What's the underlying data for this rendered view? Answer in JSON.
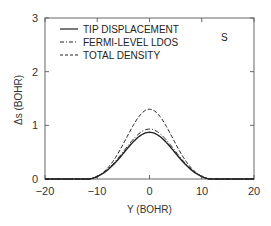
{
  "chart_data": {
    "type": "line",
    "title": "",
    "annotation": "S",
    "xlabel": "Y (BOHR)",
    "ylabel": "Δs (BOHR)",
    "xlim": [
      -20,
      20
    ],
    "ylim": [
      0,
      3
    ],
    "xticks": [
      -20,
      -10,
      0,
      10,
      20
    ],
    "xtick_labels": [
      "−20",
      "−10",
      "0",
      "10",
      "20"
    ],
    "yticks": [
      0,
      1,
      2,
      3
    ],
    "ytick_labels": [
      "0",
      "1",
      "2",
      "3"
    ],
    "grid": false,
    "legend_position": "upper left",
    "x": [
      -12,
      -11,
      -10,
      -9,
      -8,
      -7,
      -6,
      -5,
      -4,
      -3,
      -2,
      -1,
      0,
      1,
      2,
      3,
      4,
      5,
      6,
      7,
      8,
      9,
      10,
      11,
      12
    ],
    "series": [
      {
        "name": "TIP DISPLACEMENT",
        "style": "solid",
        "peak": 0.87,
        "values": [
          0,
          0.0,
          0.04,
          0.1,
          0.18,
          0.28,
          0.39,
          0.51,
          0.63,
          0.73,
          0.81,
          0.86,
          0.87,
          0.86,
          0.81,
          0.73,
          0.63,
          0.51,
          0.39,
          0.28,
          0.18,
          0.1,
          0.04,
          0.0,
          0
        ]
      },
      {
        "name": "FERMI-LEVEL LDOS",
        "style": "dashdot",
        "peak": 0.93,
        "values": [
          0,
          0.01,
          0.05,
          0.12,
          0.2,
          0.3,
          0.42,
          0.55,
          0.67,
          0.78,
          0.87,
          0.92,
          0.93,
          0.92,
          0.87,
          0.78,
          0.67,
          0.55,
          0.42,
          0.3,
          0.2,
          0.12,
          0.05,
          0.01,
          0
        ]
      },
      {
        "name": "TOTAL DENSITY",
        "style": "dashed",
        "peak": 1.3,
        "values": [
          0,
          0.0,
          0.03,
          0.09,
          0.19,
          0.33,
          0.5,
          0.69,
          0.88,
          1.05,
          1.19,
          1.27,
          1.3,
          1.27,
          1.19,
          1.05,
          0.88,
          0.69,
          0.5,
          0.33,
          0.19,
          0.09,
          0.03,
          0.0,
          0
        ]
      }
    ]
  }
}
